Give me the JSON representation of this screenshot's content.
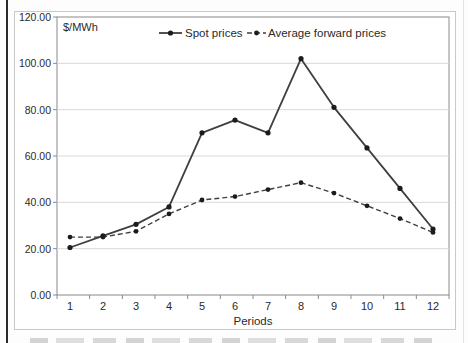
{
  "chart_data": {
    "type": "line",
    "unit_label": "$/MWh",
    "xlabel": "Periods",
    "categories": [
      "1",
      "2",
      "3",
      "4",
      "5",
      "6",
      "7",
      "8",
      "9",
      "10",
      "11",
      "12"
    ],
    "series": [
      {
        "name": "Spot prices",
        "line_style": "solid",
        "marker": "filled-circle",
        "values": [
          20.5,
          25.5,
          30.5,
          38,
          70,
          75.5,
          70,
          102,
          81,
          63.5,
          46,
          28.5
        ]
      },
      {
        "name": "Average forward prices",
        "line_style": "dashed",
        "marker": "filled-circle",
        "values": [
          25,
          25,
          27.5,
          35,
          41,
          42.5,
          45.5,
          48.5,
          44,
          38.5,
          33,
          27
        ]
      }
    ],
    "ylim": [
      0,
      120
    ],
    "ytick_step": 20,
    "ytick_labels": [
      "0.00",
      "20.00",
      "40.00",
      "60.00",
      "80.00",
      "100.00",
      "120.00"
    ],
    "grid": true,
    "legend_position": "top-center",
    "colors": {
      "line": "#3f3f3f",
      "marker": "#1c1c1c",
      "gridline": "#d9d9d9",
      "plot_border": "#8a8a8a",
      "figure_border": "#c9c9c9",
      "text": "#2a2a2a"
    }
  }
}
